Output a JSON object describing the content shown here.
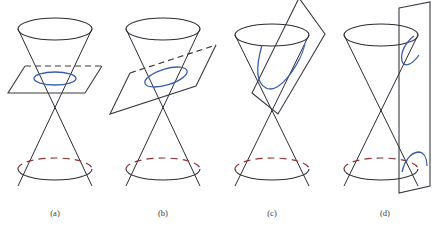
{
  "figure": {
    "background_color": "#ffffff",
    "cone_color": "#2b2b33",
    "plane_color": "#3a3a42",
    "conic_color": "#3a5fa8",
    "hidden_arc_color": "#8c3434"
  },
  "panels": [
    {
      "id": "panel-a",
      "caption": "(a)",
      "conic_name": "circle",
      "plane_orientation": "horizontal",
      "description": "Plane perpendicular to the axis of the double cone cuts one nappe in a circle",
      "center_x": 55
    },
    {
      "id": "panel-b",
      "caption": "(b)",
      "conic_name": "ellipse",
      "plane_orientation": "oblique",
      "description": "Plane tilted at a shallow angle cuts one nappe in an ellipse",
      "center_x": 163
    },
    {
      "id": "panel-c",
      "caption": "(c)",
      "conic_name": "parabola",
      "plane_orientation": "parallel-to-generator",
      "description": "Plane parallel to a generating line cuts one nappe in a parabola",
      "center_x": 272
    },
    {
      "id": "panel-d",
      "caption": "(d)",
      "conic_name": "hyperbola",
      "plane_orientation": "vertical",
      "description": "Vertical plane cuts both nappes in the two branches of a hyperbola",
      "center_x": 385
    }
  ],
  "captions": {
    "a": "(a)",
    "b": "(b)",
    "c": "(c)",
    "d": "(d)"
  }
}
